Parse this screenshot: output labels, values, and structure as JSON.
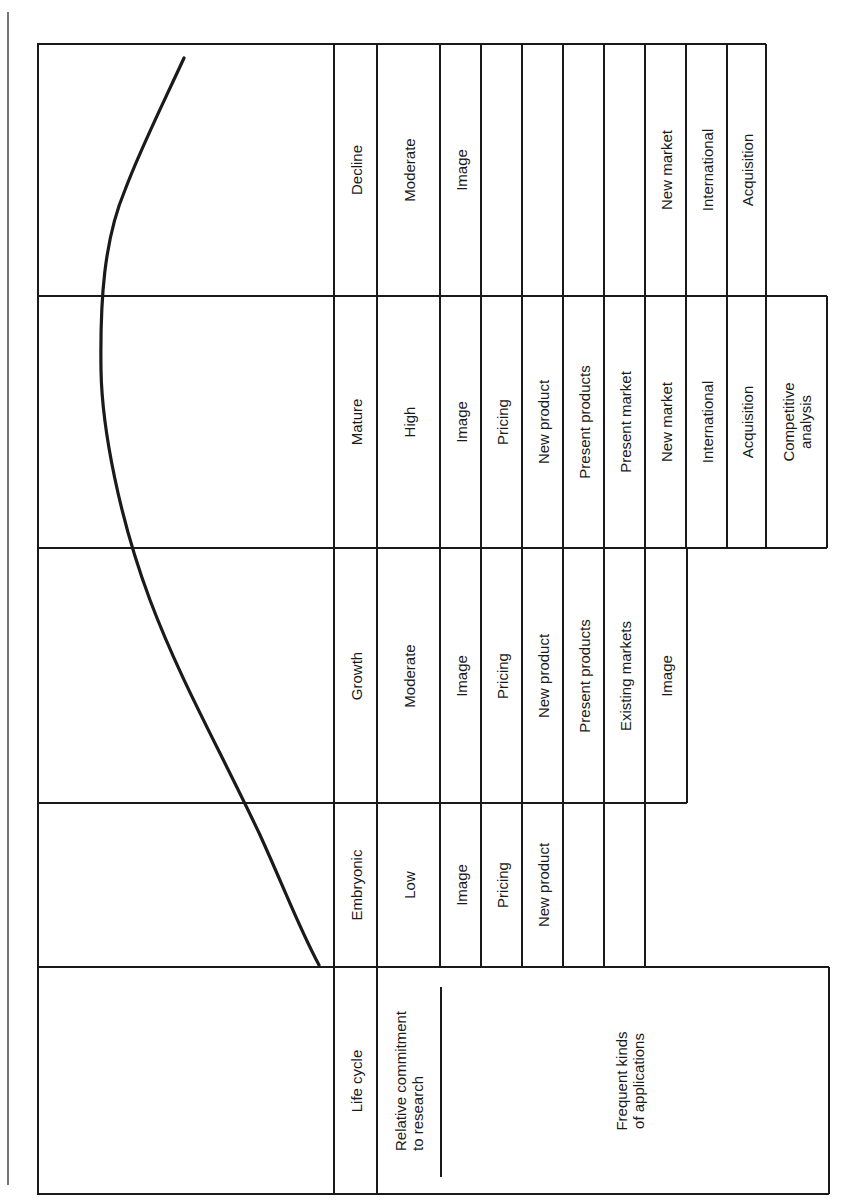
{
  "diagram": {
    "header": {
      "life_cycle": "Life cycle",
      "commitment": "Relative commitment\nto research",
      "applications": "Frequent kinds\nof applications"
    },
    "stages": [
      {
        "name": "Embryonic",
        "commitment": "Low",
        "applications": [
          "Image",
          "Pricing",
          "New product"
        ]
      },
      {
        "name": "Growth",
        "commitment": "Moderate",
        "applications": [
          "Image",
          "Pricing",
          "New product",
          "Present products",
          "Existing markets",
          "Image"
        ]
      },
      {
        "name": "Mature",
        "commitment": "High",
        "applications": [
          "Image",
          "Pricing",
          "New product",
          "Present products",
          "Present market",
          "New market",
          "International",
          "Acquisition",
          "Competitive\nanalysis"
        ]
      },
      {
        "name": "Decline",
        "commitment": "Moderate",
        "applications": [
          "Image",
          "",
          "",
          "",
          "",
          "New market",
          "International",
          "Acquisition"
        ]
      }
    ],
    "curve": "life-cycle-curve",
    "colors": {
      "line": "#1a1a1a",
      "background": "#ffffff"
    }
  }
}
